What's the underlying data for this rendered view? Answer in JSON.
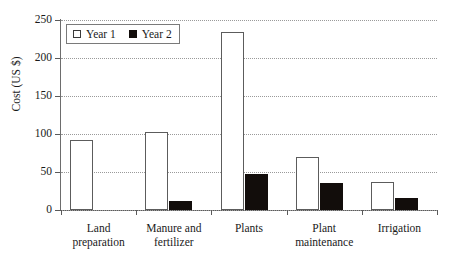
{
  "chart_data": {
    "type": "bar",
    "title": "",
    "xlabel": "",
    "ylabel": "Cost (US $)",
    "ylim": [
      0,
      250
    ],
    "yticks": [
      0,
      50,
      100,
      150,
      200,
      250
    ],
    "grid": true,
    "legend_position": "top-left",
    "categories": [
      "Land preparation",
      "Manure and fertilizer",
      "Plants",
      "Plant maintenance",
      "Irrigation"
    ],
    "category_lines": [
      [
        "Land",
        "preparation"
      ],
      [
        "Manure and",
        "fertilizer"
      ],
      [
        "Plants",
        ""
      ],
      [
        "Plant",
        "maintenance"
      ],
      [
        "Irrigation",
        ""
      ]
    ],
    "series": [
      {
        "name": "Year 1",
        "color": "#ffffff",
        "edge_color": "#5c5c5c",
        "values": [
          92,
          102,
          234,
          70,
          37
        ]
      },
      {
        "name": "Year 2",
        "color": "#120d0b",
        "edge_color": "#120d0b",
        "values": [
          0,
          12,
          48,
          36,
          16
        ]
      }
    ]
  },
  "axis": {
    "y_title": "Cost (US $)",
    "y_tick_labels": [
      "250",
      "200",
      "150",
      "100",
      "50",
      "0"
    ]
  },
  "legend": {
    "items": [
      {
        "label": "Year 1",
        "swatch": "open-square-icon"
      },
      {
        "label": "Year 2",
        "swatch": "filled-square-icon"
      }
    ]
  },
  "colors": {
    "year1_fill": "#ffffff",
    "year1_edge": "#5c5c5c",
    "year2_fill": "#120d0b",
    "axis": "#5a5a5a",
    "gridline": "#9a9a9a",
    "text": "#1a1a1a",
    "background": "#ffffff"
  }
}
